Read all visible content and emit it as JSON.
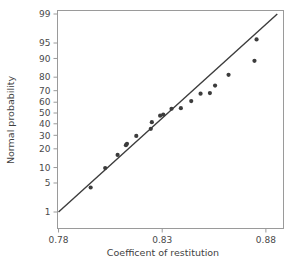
{
  "chart_data": {
    "type": "scatter",
    "title": "",
    "subtitle": "",
    "xlabel": "Coefficent of restitution",
    "ylabel": "Normal probability",
    "xlim": [
      0.7795,
      0.8885
    ],
    "ylim": [
      0.5,
      99.5
    ],
    "grid": false,
    "legend": null,
    "x_ticks": [
      {
        "value": 0.78,
        "label": "0.78"
      },
      {
        "value": 0.83,
        "label": "0.83"
      },
      {
        "value": 0.88,
        "label": "0.88"
      }
    ],
    "y_ticks": [
      {
        "value": 1,
        "label": "1"
      },
      {
        "value": 5,
        "label": "5"
      },
      {
        "value": 10,
        "label": "10"
      },
      {
        "value": 20,
        "label": "20"
      },
      {
        "value": 30,
        "label": "30"
      },
      {
        "value": 40,
        "label": "40"
      },
      {
        "value": 50,
        "label": "50"
      },
      {
        "value": 60,
        "label": "60"
      },
      {
        "value": 70,
        "label": "70"
      },
      {
        "value": 80,
        "label": "80"
      },
      {
        "value": 90,
        "label": "90"
      },
      {
        "value": 95,
        "label": "95"
      },
      {
        "value": 99,
        "label": "99"
      }
    ],
    "y_scale": "normal-probability",
    "series": [
      {
        "name": "Coefficient of restitution sample",
        "kind": "scatter",
        "marker": "filled-circle",
        "color": "#3c3c3c",
        "x": [
          0.7955,
          0.8025,
          0.8085,
          0.8125,
          0.813,
          0.8175,
          0.8245,
          0.825,
          0.829,
          0.8305,
          0.8345,
          0.839,
          0.844,
          0.8485,
          0.853,
          0.8555,
          0.862,
          0.8745,
          0.8755
        ],
        "y": [
          4.0,
          9.8,
          16.2,
          22.5,
          23.5,
          29.5,
          35.5,
          41.5,
          47.5,
          48.5,
          54.0,
          54.5,
          61.0,
          67.5,
          68.0,
          74.0,
          81.5,
          89.0,
          95.8
        ]
      },
      {
        "name": "Reference line",
        "kind": "line",
        "color": "#3c3c3c",
        "x": [
          0.78,
          0.8855
        ],
        "y": [
          1.0,
          99.0
        ]
      }
    ],
    "point_count": 19
  },
  "figure": {
    "background_color": "#ffffff",
    "axis_color": "#9a9a9a",
    "ink_color": "#3c3c3c"
  }
}
